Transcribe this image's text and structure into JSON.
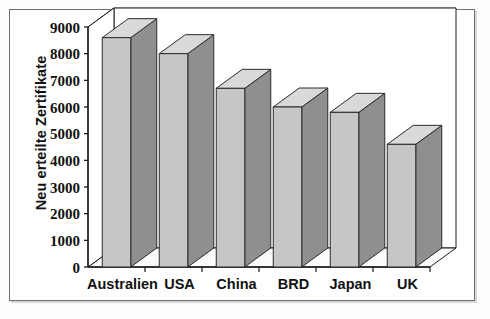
{
  "chart_data": {
    "type": "bar",
    "title": "",
    "subtitle": "",
    "xlabel": "",
    "ylabel": "Neu erteilte Zertifikate",
    "categories": [
      "Australien",
      "USA",
      "China",
      "BRD",
      "Japan",
      "UK"
    ],
    "values": [
      8600,
      8000,
      6700,
      6000,
      5800,
      4600
    ],
    "series": [
      {
        "name": "Neu erteilte Zertifikate",
        "values": [
          8600,
          8000,
          6700,
          6000,
          5800,
          4600
        ]
      }
    ],
    "ylim": [
      0,
      9000
    ],
    "yticks": [
      0,
      1000,
      2000,
      3000,
      4000,
      5000,
      6000,
      7000,
      8000,
      9000
    ],
    "ytick_labels": [
      "0",
      "1000",
      "2000",
      "3000",
      "4000",
      "5000",
      "6000",
      "7000",
      "8000",
      "9000"
    ],
    "grid": true,
    "grid_axis": "y",
    "legend": false,
    "legend_position": "none",
    "style": "3d-column",
    "annotations": []
  },
  "colors": {
    "bar_front": "#c6c6c6",
    "bar_side": "#8f8f8f",
    "bar_top": "#d9d9d9",
    "bar_outline": "#2b2b2b",
    "grid": "#8a8a8a",
    "axis": "#1a1a1a",
    "frame": "#6e6e6e",
    "background": "#ffffff",
    "text": "#111111"
  }
}
